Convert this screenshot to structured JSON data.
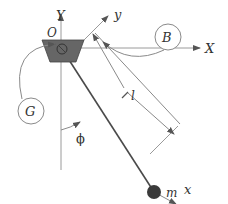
{
  "diagram": {
    "labels": {
      "Y": "Y",
      "X": "X",
      "O": "O",
      "y": "y",
      "x": "x",
      "B": "B",
      "G": "G",
      "l": "l",
      "phi": "ϕ",
      "m": "m"
    },
    "colors": {
      "line": "#8a8a8a",
      "rod": "#4a4a4a",
      "pivot": "#555555",
      "mass": "#3a3a3a",
      "text": "#333333"
    }
  }
}
